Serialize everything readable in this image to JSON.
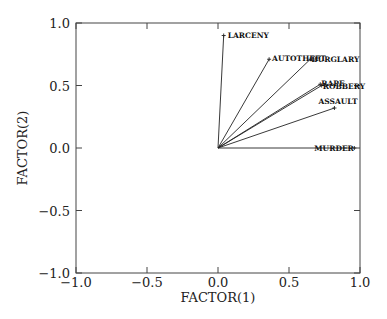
{
  "chart_data": {
    "type": "scatter",
    "subtype": "factor-loading-vector-plot",
    "title": "",
    "xlabel": "FACTOR(1)",
    "ylabel": "FACTOR(2)",
    "xlim": [
      -1.0,
      1.0
    ],
    "ylim": [
      -1.0,
      1.0
    ],
    "xticks": [
      -1.0,
      -0.5,
      0.0,
      0.5,
      1.0
    ],
    "yticks": [
      -1.0,
      -0.5,
      0.0,
      0.5,
      1.0
    ],
    "xtick_labels": [
      "−1.0",
      "−0.5",
      "0.0",
      "0.5",
      "1.0"
    ],
    "ytick_labels": [
      "−1.0",
      "−0.5",
      "0.0",
      "0.5",
      "1.0"
    ],
    "grid": false,
    "legend": null,
    "origin": [
      0.0,
      0.0
    ],
    "points": [
      {
        "label": "LARCENY",
        "x": 0.04,
        "y": 0.9
      },
      {
        "label": "AUTOTHEFT",
        "x": 0.36,
        "y": 0.71
      },
      {
        "label": "BURGLARY",
        "x": 0.65,
        "y": 0.71
      },
      {
        "label": "RAPE",
        "x": 0.72,
        "y": 0.51
      },
      {
        "label": "ROBBERY",
        "x": 0.73,
        "y": 0.5
      },
      {
        "label": "ASSAULT",
        "x": 0.82,
        "y": 0.32
      },
      {
        "label": "MURDER",
        "x": 0.96,
        "y": 0.0
      }
    ]
  }
}
